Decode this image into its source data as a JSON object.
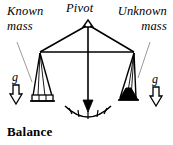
{
  "figure": {
    "caption": "Balance",
    "pivot_label": "Pivot",
    "known_mass": {
      "line1": "Known",
      "line2": "mass",
      "gravity_label": "g"
    },
    "unknown_mass": {
      "line1": "Unknown",
      "line2": "mass",
      "gravity_label": "g"
    },
    "colors": {
      "ink": "#000000",
      "background": "#ffffff",
      "leader_line": "#9a9a9a",
      "mass_fill": "#000000"
    },
    "geometry": {
      "pivot_apex_x": 88,
      "pivot_apex_y": 22,
      "beam_left_x": 40,
      "beam_right_x": 134,
      "beam_y": 52,
      "pan_y": 97,
      "gauge_tick_count": 5
    }
  }
}
